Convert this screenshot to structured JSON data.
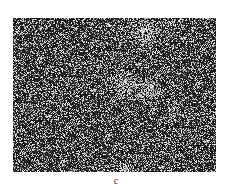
{
  "figure": {
    "panel_label": "c",
    "image": {
      "description": "Grayscale noisy micrograph-style image with speckle texture",
      "width": 203,
      "height": 154,
      "base_color": "#1a1a1a",
      "speckle_color": "#d8d8d8",
      "bright_regions": [
        {
          "x": 133,
          "y": 12,
          "r": 12
        },
        {
          "x": 112,
          "y": 66,
          "r": 11
        },
        {
          "x": 135,
          "y": 72,
          "r": 10
        },
        {
          "x": 160,
          "y": 94,
          "r": 5
        },
        {
          "x": 112,
          "y": 150,
          "r": 5
        }
      ]
    }
  }
}
